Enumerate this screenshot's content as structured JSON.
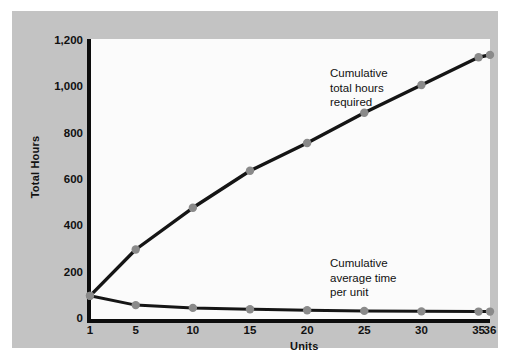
{
  "figure": {
    "background_color": "#c3c3c3",
    "plot_background_color": "#fbfbfb",
    "axis_color": "#0d0d0d",
    "line_color": "#151515",
    "marker_color": "#8a8a8a"
  },
  "chart_data": {
    "type": "line",
    "title": "",
    "xlabel": "Units",
    "ylabel": "Total Hours",
    "xlim": [
      1,
      36
    ],
    "ylim": [
      0,
      1200
    ],
    "grid": false,
    "legend_position": "inline-annotations",
    "x": [
      1,
      5,
      10,
      15,
      20,
      25,
      30,
      35,
      36
    ],
    "xtick_labels": [
      "1",
      "5",
      "10",
      "15",
      "20",
      "25",
      "30",
      "35",
      "36"
    ],
    "ytick_labels": [
      "0",
      "200",
      "400",
      "600",
      "800",
      "1,000",
      "1,200"
    ],
    "ytick_values": [
      0,
      200,
      400,
      600,
      800,
      1000,
      1200
    ],
    "series": [
      {
        "name": "Cumulative total hours required",
        "annotation": "Cumulative\ntotal hours\nrequired",
        "values": [
          100,
          300,
          480,
          640,
          760,
          890,
          1010,
          1130,
          1140
        ]
      },
      {
        "name": "Cumulative average time per unit",
        "annotation": "Cumulative\naverage time\nper unit",
        "values": [
          100,
          60,
          48,
          42,
          38,
          35,
          33,
          32,
          32
        ]
      }
    ]
  }
}
